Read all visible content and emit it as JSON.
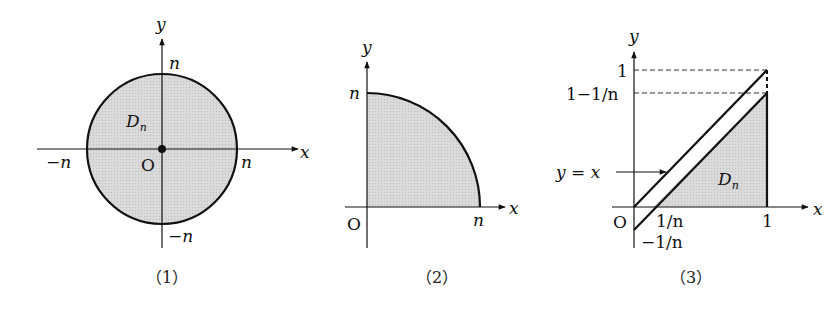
{
  "figures": [
    {
      "id": "fig1",
      "caption": "（1）",
      "region_label": "D",
      "region_sub": "n",
      "axis_x": "x",
      "axis_y": "y",
      "origin": "O",
      "ticks": {
        "x_neg": "−n",
        "x_pos": "n",
        "y_pos": "n",
        "y_neg": "−n"
      },
      "shape": "disk of radius n centered at origin"
    },
    {
      "id": "fig2",
      "caption": "（2）",
      "axis_x": "x",
      "axis_y": "y",
      "origin": "O",
      "ticks": {
        "x_pos": "n",
        "y_pos": "n"
      },
      "shape": "quarter disk of radius n in first quadrant"
    },
    {
      "id": "fig3",
      "caption": "（3）",
      "region_label": "D",
      "region_sub": "n",
      "axis_x": "x",
      "axis_y": "y",
      "origin": "O",
      "line_label": "y = x",
      "ticks": {
        "y_one": "1",
        "y_one_minus": "1−1/n",
        "x_one_over_n": "1/n",
        "x_one": "1",
        "y_neg_one_over_n": "−1/n"
      },
      "shape": "triangle between y = x − 1/n, x-axis and x = 1"
    }
  ],
  "colors": {
    "fill": "#d4d4d4",
    "stroke": "#111111",
    "background": "#ffffff"
  }
}
